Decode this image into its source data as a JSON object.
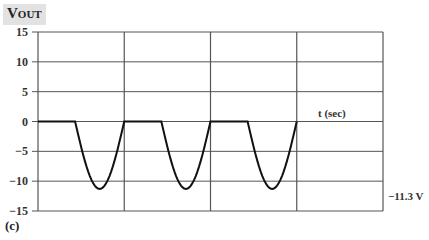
{
  "chart_data": {
    "type": "line",
    "title": "",
    "ylabel": "V_OUT",
    "xlabel": "t (sec)",
    "ylim": [
      -15,
      15
    ],
    "yticks": [
      15,
      10,
      5,
      0,
      -5,
      -10,
      -15
    ],
    "ytick_labels": [
      "15",
      "10",
      "5",
      "0",
      "−5",
      "−10",
      "−15"
    ],
    "x_grid_divisions": 4,
    "grid": true,
    "legend": null,
    "annotations": [
      "t (sec)",
      "−11.3 V"
    ],
    "series": [
      {
        "name": "V_OUT",
        "description": "Half-wave rectified negative output: 0 V for first part of each period, then negative half-sine pulse reaching -11.3 V",
        "x_periods": [
          0,
          1,
          2,
          3
        ],
        "points": [
          [
            0.0,
            0
          ],
          [
            0.43,
            0
          ],
          [
            0.5,
            -5
          ],
          [
            0.62,
            -10.5
          ],
          [
            0.72,
            -11.3
          ],
          [
            0.82,
            -10.5
          ],
          [
            0.93,
            -5
          ],
          [
            1.0,
            0
          ],
          [
            1.0,
            0
          ],
          [
            1.43,
            0
          ],
          [
            1.5,
            -5
          ],
          [
            1.62,
            -10.5
          ],
          [
            1.72,
            -11.3
          ],
          [
            1.82,
            -10.5
          ],
          [
            1.93,
            -5
          ],
          [
            2.0,
            0
          ],
          [
            2.0,
            0
          ],
          [
            2.43,
            0
          ],
          [
            2.5,
            -5
          ],
          [
            2.62,
            -10.5
          ],
          [
            2.72,
            -11.3
          ],
          [
            2.82,
            -10.5
          ],
          [
            2.93,
            -5
          ],
          [
            3.0,
            0
          ]
        ],
        "min_value": -11.3,
        "max_value": 0
      }
    ]
  },
  "labels": {
    "y_axis_title_main": "V",
    "y_axis_title_sub": "OUT",
    "x_axis_title": "t (sec)",
    "peak_annotation": "−11.3 V",
    "panel_label": "(c)"
  }
}
